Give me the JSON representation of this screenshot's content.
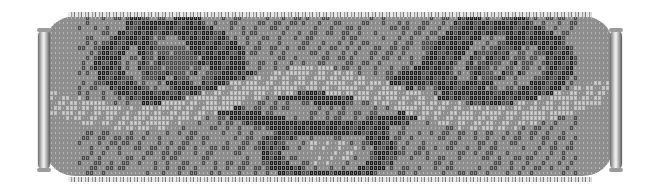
{
  "image": {
    "subject": "Loom-woven seed bead bracelet with slide clasps",
    "palette": {
      "light_bead": "#bdbdbd",
      "mid_bead": "#8e8e8e",
      "dark_bead": "#4a4a4a",
      "darkest_bead": "#1e1e1e",
      "clasp_metal": "#d8d8d8",
      "background": "#ffffff"
    },
    "components": {
      "band": "Beaded band with swirl/arch motif",
      "left_clasp": "Silver tube slide clasp",
      "right_clasp": "Silver tube slide clasp",
      "edge_beads": "Picot edging along top and bottom"
    }
  }
}
